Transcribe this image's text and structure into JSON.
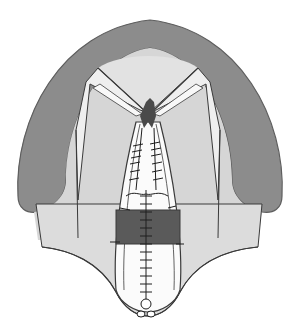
{
  "figure": {
    "type": "medical-illustration",
    "colors": {
      "background": "#ffffff",
      "outer_arch": "#8c8c8c",
      "inner_palate": "#d6d6d6",
      "soft_field": "#e4e4e4",
      "flap_highlight": "#f4f4f4",
      "midline_flap": "#fbfbfb",
      "defect_block": "#5a5a5a",
      "outline": "#3a3a3a",
      "suture": "#1e1e1e"
    }
  }
}
